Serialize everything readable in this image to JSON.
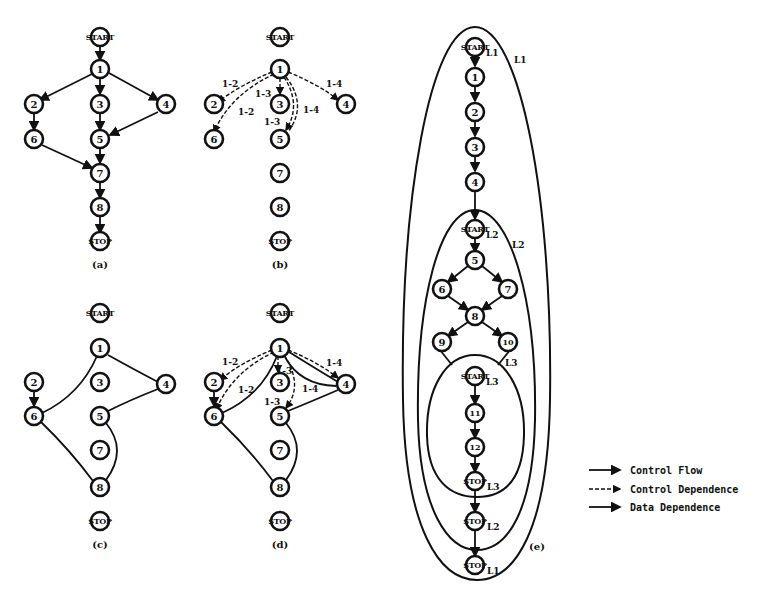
{
  "figure": {
    "panels": [
      {
        "id": "a",
        "caption": "(a)"
      },
      {
        "id": "b",
        "caption": "(b)"
      },
      {
        "id": "c",
        "caption": "(c)"
      },
      {
        "id": "d",
        "caption": "(d)"
      },
      {
        "id": "e",
        "caption": "(e)"
      }
    ],
    "start_label": "START",
    "stop_label": "STOP",
    "nodes": {
      "n1": "1",
      "n2": "2",
      "n3": "3",
      "n4": "4",
      "n5": "5",
      "n6": "6",
      "n7": "7",
      "n8": "8",
      "n9": "9",
      "n10": "10",
      "n11": "11",
      "n12": "12"
    },
    "dependence_labels": {
      "d12": "1-2",
      "d13": "1-3",
      "d14": "1-4"
    },
    "loop_labels": {
      "L1": "L1",
      "L2": "L2",
      "L3": "L3"
    },
    "legend": {
      "items": [
        {
          "label": "Control Flow"
        },
        {
          "label": "Control Dependence"
        },
        {
          "label": "Data Dependence"
        }
      ]
    }
  }
}
